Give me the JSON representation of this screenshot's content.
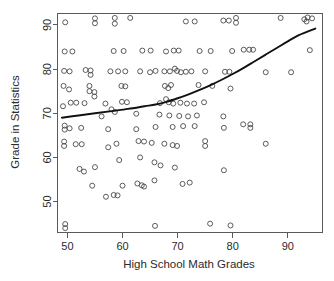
{
  "chart_data": {
    "type": "scatter",
    "title": "",
    "xlabel": "High School Math Grades",
    "ylabel": "Grade in Statistics",
    "xlim": [
      48.2,
      96.3
    ],
    "ylim": [
      43.0,
      92.6
    ],
    "xticks": [
      50,
      60,
      70,
      80,
      90
    ],
    "yticks": [
      50,
      60,
      70,
      80,
      90
    ],
    "xtick_labels": [
      "50",
      "60",
      "70",
      "80",
      "90"
    ],
    "ytick_labels": [
      "50",
      "60",
      "70",
      "80",
      "90"
    ],
    "grid": false,
    "legend": null,
    "marker": "open-circle",
    "points": [
      [
        49.6,
        90.6
      ],
      [
        55.0,
        91.5
      ],
      [
        55.0,
        90.4
      ],
      [
        58.6,
        91.6
      ],
      [
        58.6,
        90.3
      ],
      [
        61.4,
        91.6
      ],
      [
        71.5,
        90.8
      ],
      [
        73.1,
        90.8
      ],
      [
        78.3,
        91.0
      ],
      [
        79.3,
        91.0
      ],
      [
        80.6,
        91.6
      ],
      [
        80.6,
        90.5
      ],
      [
        88.7,
        91.6
      ],
      [
        93.0,
        91.3
      ],
      [
        93.6,
        91.7
      ],
      [
        94.4,
        91.5
      ],
      [
        93.4,
        90.8
      ],
      [
        49.5,
        84.0
      ],
      [
        50.9,
        84.0
      ],
      [
        58.4,
        84.1
      ],
      [
        60.2,
        84.1
      ],
      [
        63.6,
        84.2
      ],
      [
        65.1,
        84.2
      ],
      [
        67.9,
        84.0
      ],
      [
        69.3,
        84.2
      ],
      [
        70.2,
        84.2
      ],
      [
        74.0,
        84.1
      ],
      [
        76.0,
        84.1
      ],
      [
        79.9,
        84.1
      ],
      [
        82.0,
        84.4
      ],
      [
        83.0,
        84.4
      ],
      [
        83.7,
        84.4
      ],
      [
        94.0,
        84.3
      ],
      [
        49.4,
        79.6
      ],
      [
        50.4,
        79.5
      ],
      [
        53.3,
        79.8
      ],
      [
        54.2,
        79.7
      ],
      [
        54.2,
        78.7
      ],
      [
        57.8,
        79.5
      ],
      [
        59.2,
        79.5
      ],
      [
        60.5,
        79.5
      ],
      [
        63.2,
        79.5
      ],
      [
        65.0,
        79.3
      ],
      [
        66.0,
        79.6
      ],
      [
        67.6,
        79.5
      ],
      [
        68.6,
        79.5
      ],
      [
        69.5,
        80.1
      ],
      [
        69.9,
        79.6
      ],
      [
        70.6,
        79.3
      ],
      [
        71.5,
        79.4
      ],
      [
        72.5,
        79.5
      ],
      [
        75.0,
        79.5
      ],
      [
        78.6,
        79.4
      ],
      [
        79.4,
        79.4
      ],
      [
        86.0,
        79.3
      ],
      [
        90.6,
        79.3
      ],
      [
        49.3,
        76.2
      ],
      [
        50.3,
        75.4
      ],
      [
        54.0,
        76.2
      ],
      [
        54.0,
        75.0
      ],
      [
        59.8,
        76.2
      ],
      [
        60.5,
        76.1
      ],
      [
        67.7,
        76.2
      ],
      [
        68.3,
        75.7
      ],
      [
        68.8,
        76.4
      ],
      [
        73.8,
        76.4
      ],
      [
        76.3,
        76.2
      ],
      [
        79.6,
        75.6
      ],
      [
        49.2,
        71.6
      ],
      [
        50.6,
        72.4
      ],
      [
        51.6,
        72.4
      ],
      [
        53.1,
        72.3
      ],
      [
        56.9,
        72.2
      ],
      [
        59.9,
        72.6
      ],
      [
        60.8,
        72.5
      ],
      [
        66.8,
        72.3
      ],
      [
        67.9,
        73.2
      ],
      [
        68.4,
        72.5
      ],
      [
        69.2,
        72.2
      ],
      [
        70.5,
        72.4
      ],
      [
        71.7,
        72.2
      ],
      [
        73.0,
        72.2
      ],
      [
        74.8,
        72.5
      ],
      [
        54.9,
        74.8
      ],
      [
        54.9,
        73.8
      ],
      [
        58.0,
        70.9
      ],
      [
        58.6,
        70.3
      ],
      [
        56.2,
        69.3
      ],
      [
        62.5,
        69.9
      ],
      [
        66.7,
        69.7
      ],
      [
        68.5,
        69.5
      ],
      [
        70.3,
        69.4
      ],
      [
        71.9,
        69.3
      ],
      [
        73.5,
        69.5
      ],
      [
        78.3,
        69.3
      ],
      [
        49.5,
        67.2
      ],
      [
        49.5,
        66.3
      ],
      [
        50.4,
        66.6
      ],
      [
        52.5,
        66.7
      ],
      [
        57.4,
        66.4
      ],
      [
        62.5,
        66.4
      ],
      [
        66.0,
        66.9
      ],
      [
        69.1,
        66.9
      ],
      [
        71.0,
        67.1
      ],
      [
        73.1,
        67.1
      ],
      [
        78.4,
        66.7
      ],
      [
        81.9,
        67.5
      ],
      [
        83.2,
        67.5
      ],
      [
        83.2,
        66.7
      ],
      [
        49.4,
        63.6
      ],
      [
        49.4,
        62.6
      ],
      [
        51.5,
        63.0
      ],
      [
        52.6,
        63.0
      ],
      [
        57.4,
        62.3
      ],
      [
        58.9,
        63.1
      ],
      [
        62.9,
        63.7
      ],
      [
        63.9,
        63.6
      ],
      [
        65.3,
        63.3
      ],
      [
        67.6,
        63.1
      ],
      [
        69.1,
        62.8
      ],
      [
        69.9,
        62.6
      ],
      [
        75.0,
        63.7
      ],
      [
        75.0,
        62.6
      ],
      [
        86.0,
        63.1
      ],
      [
        52.2,
        57.4
      ],
      [
        53.0,
        56.8
      ],
      [
        55.0,
        57.8
      ],
      [
        59.4,
        59.4
      ],
      [
        63.2,
        60.0
      ],
      [
        65.8,
        58.9
      ],
      [
        66.9,
        58.2
      ],
      [
        69.5,
        57.7
      ],
      [
        78.4,
        57.1
      ],
      [
        54.5,
        53.6
      ],
      [
        57.0,
        51.1
      ],
      [
        58.4,
        51.5
      ],
      [
        59.1,
        51.4
      ],
      [
        60.0,
        53.6
      ],
      [
        62.7,
        54.1
      ],
      [
        63.5,
        53.7
      ],
      [
        63.9,
        53.4
      ],
      [
        65.8,
        54.8
      ],
      [
        70.9,
        54.0
      ],
      [
        72.2,
        54.3
      ],
      [
        49.6,
        44.9
      ],
      [
        49.6,
        44.0
      ],
      [
        65.9,
        44.5
      ],
      [
        75.9,
        45.0
      ],
      [
        79.6,
        44.6
      ]
    ],
    "trend_line": {
      "label": "smoothed-fit",
      "points": [
        [
          49.0,
          69.0
        ],
        [
          52.0,
          69.5
        ],
        [
          55.0,
          70.0
        ],
        [
          58.0,
          70.5
        ],
        [
          61.0,
          71.0
        ],
        [
          64.0,
          71.6
        ],
        [
          66.0,
          72.0
        ],
        [
          68.0,
          72.6
        ],
        [
          70.0,
          73.4
        ],
        [
          72.0,
          74.3
        ],
        [
          74.0,
          75.3
        ],
        [
          76.0,
          76.4
        ],
        [
          78.0,
          77.6
        ],
        [
          80.0,
          78.9
        ],
        [
          82.0,
          80.3
        ],
        [
          84.0,
          81.8
        ],
        [
          86.0,
          83.3
        ],
        [
          88.0,
          84.8
        ],
        [
          90.0,
          86.3
        ],
        [
          92.0,
          87.7
        ],
        [
          95.0,
          89.2
        ]
      ]
    }
  },
  "axes": {
    "x_axis_name": "High School Math Grades",
    "y_axis_name": "Grade in Statistics"
  }
}
